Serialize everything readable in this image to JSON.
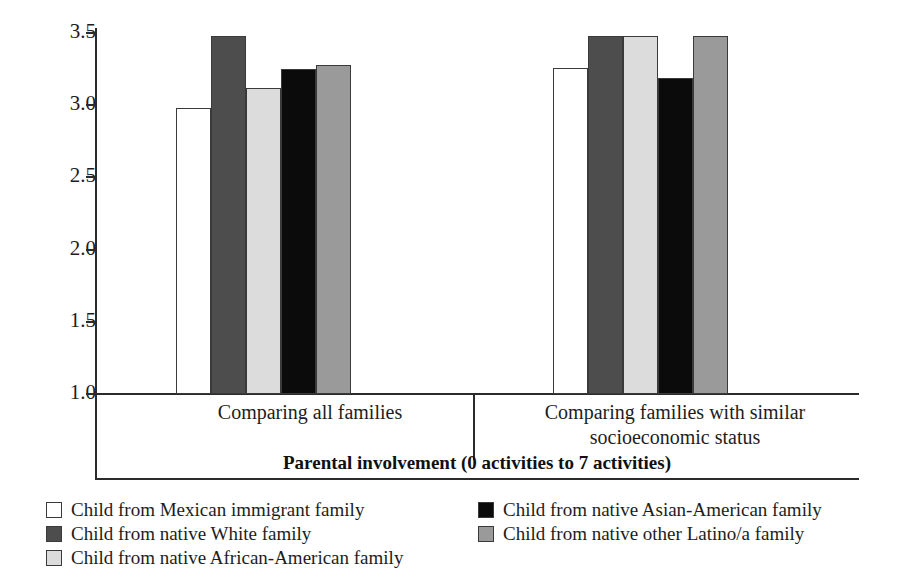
{
  "chart_data": {
    "type": "bar",
    "title": "",
    "xlabel": "Parental involvement (0 activities to 7 activities)",
    "ylabel": "",
    "ylim": [
      1.0,
      3.5
    ],
    "ytick_labels": [
      "3.5",
      "3.0",
      "2.5",
      "2.0",
      "1.5",
      "1.0"
    ],
    "ytick_values": [
      3.5,
      3.0,
      2.5,
      2.0,
      1.5,
      1.0
    ],
    "grid": false,
    "legend_position": "bottom",
    "categories": [
      "Comparing all families",
      "Comparing families with similar socioeconomic status"
    ],
    "series": [
      {
        "name": "Child from Mexican immigrant family",
        "color": "#ffffff",
        "swatch": "white",
        "values": [
          2.98,
          3.26
        ]
      },
      {
        "name": "Child from native White family",
        "color": "#4d4d4d",
        "swatch": "dark-gray",
        "values": [
          3.48,
          3.48
        ]
      },
      {
        "name": "Child from native African-American family",
        "color": "#dcdcdc",
        "swatch": "light-gray",
        "values": [
          3.12,
          3.48
        ]
      },
      {
        "name": "Child from native Asian-American family",
        "color": "#0b0b0b",
        "swatch": "black",
        "values": [
          3.25,
          3.19
        ]
      },
      {
        "name": "Child from native other Latino/a family",
        "color": "#9a9a9a",
        "swatch": "medium-gray",
        "values": [
          3.28,
          3.48
        ]
      }
    ]
  },
  "legend": {
    "left_column": [
      "Child from Mexican immigrant family",
      "Child from native White family",
      "Child from native African-American family"
    ],
    "right_column": [
      "Child from native Asian-American family",
      "Child from native other Latino/a family"
    ]
  }
}
